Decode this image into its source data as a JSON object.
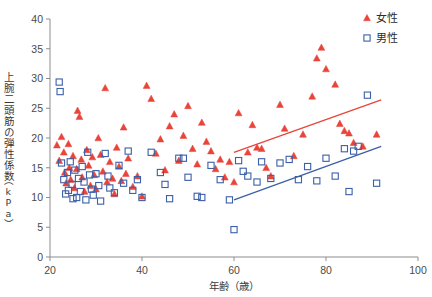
{
  "chart_data": {
    "type": "scatter",
    "title": "",
    "xlabel": "年齢（歳）",
    "ylabel": "上腕二頭筋の弾性係数（kPa）",
    "ylabel_main": "上腕二頭筋の弾性係数",
    "ylabel_unit": "（kPa）",
    "xlim": [
      20,
      100
    ],
    "ylim": [
      0,
      40
    ],
    "xticks": [
      20,
      40,
      60,
      80,
      100
    ],
    "yticks": [
      0,
      5,
      10,
      15,
      20,
      25,
      30,
      35,
      40
    ],
    "xtick_labels": [
      "20",
      "40",
      "60",
      "80",
      "100"
    ],
    "ytick_labels": [
      "0",
      "5",
      "10",
      "15",
      "20",
      "25",
      "30",
      "35",
      "40"
    ],
    "grid": false,
    "legend_position": "top-right",
    "colors": {
      "female": "#e8443a",
      "male": "#3b5fa8",
      "axis": "#8d8d8d",
      "text": "#3a3a3a"
    },
    "series": [
      {
        "name": "女性",
        "marker": "triangle",
        "color": "#e8443a",
        "points": [
          [
            21.5,
            18.8
          ],
          [
            22.0,
            16.2
          ],
          [
            22.5,
            20.2
          ],
          [
            23.0,
            17.6
          ],
          [
            23.2,
            14.2
          ],
          [
            23.5,
            12.4
          ],
          [
            24.0,
            19.0
          ],
          [
            24.2,
            15.0
          ],
          [
            24.5,
            13.0
          ],
          [
            25.0,
            17.0
          ],
          [
            25.3,
            11.6
          ],
          [
            25.8,
            14.8
          ],
          [
            26.0,
            24.6
          ],
          [
            26.4,
            23.6
          ],
          [
            26.8,
            16.4
          ],
          [
            27.0,
            13.4
          ],
          [
            27.5,
            11.0
          ],
          [
            28.0,
            18.0
          ],
          [
            28.4,
            15.4
          ],
          [
            28.8,
            12.0
          ],
          [
            29.2,
            16.8
          ],
          [
            29.6,
            13.8
          ],
          [
            30.0,
            11.4
          ],
          [
            30.5,
            20.0
          ],
          [
            31.0,
            17.2
          ],
          [
            31.5,
            14.4
          ],
          [
            32.0,
            28.4
          ],
          [
            32.4,
            12.6
          ],
          [
            33.0,
            16.0
          ],
          [
            33.6,
            13.2
          ],
          [
            34.0,
            10.6
          ],
          [
            34.5,
            18.4
          ],
          [
            35.0,
            15.2
          ],
          [
            35.5,
            12.8
          ],
          [
            36.0,
            21.8
          ],
          [
            36.5,
            14.0
          ],
          [
            37.0,
            16.6
          ],
          [
            38.0,
            11.8
          ],
          [
            39.0,
            13.6
          ],
          [
            40.0,
            10.2
          ],
          [
            41.0,
            28.8
          ],
          [
            42.0,
            26.6
          ],
          [
            43.0,
            17.4
          ],
          [
            44.0,
            19.8
          ],
          [
            45.0,
            14.6
          ],
          [
            46.0,
            22.0
          ],
          [
            47.0,
            24.0
          ],
          [
            48.0,
            16.2
          ],
          [
            49.0,
            20.4
          ],
          [
            50.0,
            25.4
          ],
          [
            51.0,
            18.2
          ],
          [
            52.0,
            15.6
          ],
          [
            53.0,
            22.6
          ],
          [
            54.0,
            19.4
          ],
          [
            55.0,
            17.8
          ],
          [
            56.0,
            14.8
          ],
          [
            57.0,
            16.4
          ],
          [
            58.0,
            13.4
          ],
          [
            59.0,
            16.0
          ],
          [
            60.0,
            12.6
          ],
          [
            61.0,
            24.2
          ],
          [
            63.0,
            17.6
          ],
          [
            64.0,
            22.2
          ],
          [
            65.0,
            18.4
          ],
          [
            66.0,
            18.2
          ],
          [
            67.0,
            15.0
          ],
          [
            68.0,
            13.6
          ],
          [
            70.0,
            25.6
          ],
          [
            71.0,
            21.6
          ],
          [
            73.0,
            17.0
          ],
          [
            75.0,
            20.6
          ],
          [
            77.0,
            27.0
          ],
          [
            78.0,
            33.4
          ],
          [
            79.0,
            35.2
          ],
          [
            80.0,
            31.6
          ],
          [
            82.0,
            29.0
          ],
          [
            83.0,
            22.4
          ],
          [
            84.0,
            21.2
          ],
          [
            85.0,
            20.8
          ],
          [
            86.0,
            19.2
          ],
          [
            88.0,
            18.6
          ],
          [
            91.0,
            20.6
          ]
        ]
      },
      {
        "name": "男性",
        "marker": "square",
        "color": "#3b5fa8",
        "points": [
          [
            22.0,
            29.4
          ],
          [
            22.2,
            27.8
          ],
          [
            22.5,
            15.8
          ],
          [
            23.0,
            13.0
          ],
          [
            23.4,
            10.6
          ],
          [
            23.8,
            14.2
          ],
          [
            24.0,
            11.2
          ],
          [
            24.4,
            16.0
          ],
          [
            24.8,
            12.2
          ],
          [
            25.0,
            9.8
          ],
          [
            25.4,
            14.6
          ],
          [
            25.8,
            10.0
          ],
          [
            26.2,
            13.2
          ],
          [
            26.6,
            11.0
          ],
          [
            27.0,
            15.2
          ],
          [
            27.4,
            12.6
          ],
          [
            27.8,
            9.6
          ],
          [
            28.2,
            17.6
          ],
          [
            28.6,
            13.8
          ],
          [
            29.0,
            11.4
          ],
          [
            29.4,
            10.4
          ],
          [
            30.0,
            14.0
          ],
          [
            30.6,
            12.0
          ],
          [
            31.0,
            9.4
          ],
          [
            32.0,
            17.4
          ],
          [
            32.6,
            13.6
          ],
          [
            33.0,
            11.6
          ],
          [
            34.0,
            10.8
          ],
          [
            35.0,
            15.4
          ],
          [
            36.0,
            12.4
          ],
          [
            37.0,
            17.8
          ],
          [
            38.0,
            11.2
          ],
          [
            39.0,
            13.0
          ],
          [
            40.0,
            10.0
          ],
          [
            42.0,
            17.6
          ],
          [
            44.0,
            14.2
          ],
          [
            45.0,
            12.2
          ],
          [
            46.0,
            9.8
          ],
          [
            48.0,
            16.6
          ],
          [
            49.0,
            16.6
          ],
          [
            50.0,
            13.4
          ],
          [
            52.0,
            10.2
          ],
          [
            53.0,
            10.0
          ],
          [
            55.0,
            15.4
          ],
          [
            57.0,
            13.0
          ],
          [
            59.0,
            9.6
          ],
          [
            60.0,
            4.6
          ],
          [
            61.0,
            16.2
          ],
          [
            62.0,
            14.4
          ],
          [
            63.0,
            13.6
          ],
          [
            65.0,
            12.6
          ],
          [
            66.0,
            16.0
          ],
          [
            68.0,
            13.2
          ],
          [
            70.0,
            15.8
          ],
          [
            72.0,
            16.4
          ],
          [
            74.0,
            13.0
          ],
          [
            76.0,
            15.2
          ],
          [
            78.0,
            12.8
          ],
          [
            80.0,
            16.6
          ],
          [
            82.0,
            13.6
          ],
          [
            84.0,
            18.2
          ],
          [
            85.0,
            11.0
          ],
          [
            86.0,
            17.8
          ],
          [
            87.0,
            18.6
          ],
          [
            89.0,
            27.2
          ],
          [
            91.0,
            12.4
          ]
        ]
      }
    ],
    "trendlines": [
      {
        "name": "女性",
        "color": "#e8443a",
        "x0": 60,
        "y0": 17.6,
        "x1": 92,
        "y1": 26.4
      },
      {
        "name": "男性",
        "color": "#3b5fa8",
        "x0": 60,
        "y0": 9.6,
        "x1": 92,
        "y1": 18.6
      }
    ]
  },
  "legend": {
    "items": [
      {
        "label": "女性",
        "marker": "triangle",
        "color": "#e8443a"
      },
      {
        "label": "男性",
        "marker": "square",
        "color": "#3b5fa8"
      }
    ]
  }
}
